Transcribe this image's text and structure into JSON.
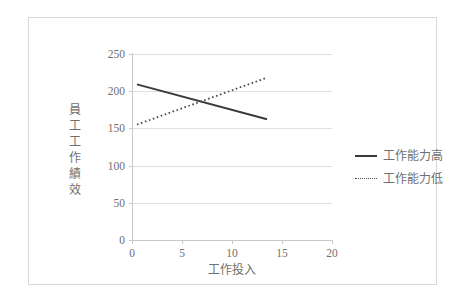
{
  "chart_data": {
    "type": "line",
    "title": "",
    "xlabel": "工作投入",
    "ylabel": "員工工作績效",
    "ylabel_chars": [
      "員",
      "工",
      "工",
      "作",
      "績",
      "效"
    ],
    "xlim": [
      0,
      20
    ],
    "ylim": [
      0,
      250
    ],
    "xticks": [
      0,
      5,
      10,
      15,
      20
    ],
    "xtick_labels": [
      "0",
      "5",
      "10",
      "15",
      "20"
    ],
    "yticks": [
      0,
      50,
      100,
      150,
      200,
      250
    ],
    "ytick_labels": [
      "0",
      "50",
      "100",
      "150",
      "200",
      "250"
    ],
    "grid": true,
    "grid_axis": "y",
    "legend_position": "right",
    "series": [
      {
        "name": "工作能力高",
        "style": "solid",
        "color": "#3a3a3a",
        "x": [
          3.4,
          16.4
        ],
        "values": [
          185,
          138
        ]
      },
      {
        "name": "工作能力低",
        "style": "dotted",
        "color": "#4a4a4a",
        "x": [
          3.4,
          16.4
        ],
        "values": [
          131,
          194
        ]
      }
    ]
  },
  "legend": {
    "items": [
      {
        "label": "工作能力高",
        "style": "solid"
      },
      {
        "label": "工作能力低",
        "style": "dotted"
      }
    ]
  },
  "colors": {
    "background": "#ffffff",
    "frame": "#d9d9d9",
    "gridline": "#e0e0e0",
    "axis": "#c8c8c8",
    "tick_text": "#6f6f6f",
    "series_solid": "#3a3a3a",
    "series_dotted": "#4a4a4a"
  }
}
